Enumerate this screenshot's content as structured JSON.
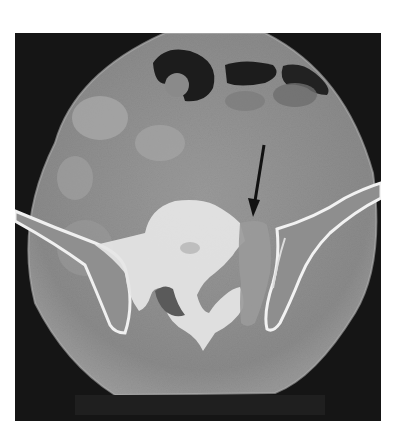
{
  "image": {
    "type": "axial CT scan",
    "description": "Axial CT image of the pelvis at the level of the sacrum and iliac wings, with a black arrow pointing to a lesion near the left sacroiliac region",
    "annotations": [
      {
        "kind": "arrow",
        "color": "#111111",
        "target": "lesion adjacent to sacrum / iliac wing"
      }
    ],
    "colors": {
      "background": "#ffffff",
      "scan_field": "#141414",
      "soft_tissue": "#8c8c8c",
      "bone": "#f2f2f2",
      "gas": "#1a1a1a"
    }
  }
}
